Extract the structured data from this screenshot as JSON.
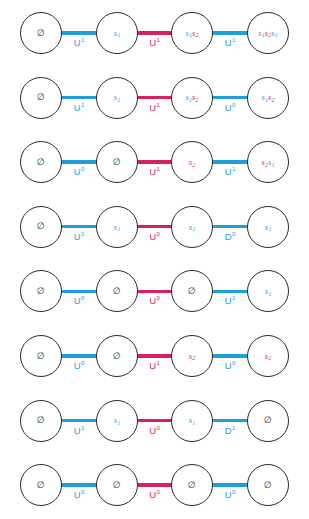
{
  "figure": {
    "colors": {
      "blue": "#1f9ed9",
      "pink": "#d81f5f",
      "node_stroke": "#2b2b2b",
      "background": "#ffffff"
    },
    "empty_set_glyph": "∅",
    "caption": "",
    "rows": [
      {
        "index": 1,
        "nodes": [
          {
            "type": "empty",
            "tokens": []
          },
          {
            "type": "word",
            "tokens": [
              {
                "base": "s",
                "sub": "1",
                "color": "blue"
              }
            ]
          },
          {
            "type": "word",
            "tokens": [
              {
                "base": "s",
                "sub": "1",
                "color": "blue"
              },
              {
                "base": "s",
                "sub": "2",
                "color": "pink"
              }
            ]
          },
          {
            "type": "word",
            "tokens": [
              {
                "base": "s",
                "sub": "1",
                "color": "blue"
              },
              {
                "base": "s",
                "sub": "2",
                "color": "pink"
              },
              {
                "base": "s",
                "sub": "1",
                "color": "blue"
              }
            ]
          }
        ],
        "edges": [
          {
            "letter": "U",
            "exponent": "1",
            "color": "blue"
          },
          {
            "letter": "U",
            "exponent": "1",
            "color": "pink"
          },
          {
            "letter": "U",
            "exponent": "1",
            "color": "blue"
          }
        ]
      },
      {
        "index": 2,
        "nodes": [
          {
            "type": "empty",
            "tokens": []
          },
          {
            "type": "word",
            "tokens": [
              {
                "base": "s",
                "sub": "1",
                "color": "blue"
              }
            ]
          },
          {
            "type": "word",
            "tokens": [
              {
                "base": "s",
                "sub": "1",
                "color": "blue"
              },
              {
                "base": "s",
                "sub": "2",
                "color": "pink"
              }
            ]
          },
          {
            "type": "word",
            "tokens": [
              {
                "base": "s",
                "sub": "1",
                "color": "blue"
              },
              {
                "base": "s",
                "sub": "2",
                "color": "pink"
              }
            ]
          }
        ],
        "edges": [
          {
            "letter": "U",
            "exponent": "1",
            "color": "blue"
          },
          {
            "letter": "U",
            "exponent": "1",
            "color": "pink"
          },
          {
            "letter": "U",
            "exponent": "0",
            "color": "blue"
          }
        ]
      },
      {
        "index": 3,
        "nodes": [
          {
            "type": "empty",
            "tokens": []
          },
          {
            "type": "empty",
            "tokens": []
          },
          {
            "type": "word",
            "tokens": [
              {
                "base": "s",
                "sub": "2",
                "color": "pink"
              }
            ]
          },
          {
            "type": "word",
            "tokens": [
              {
                "base": "s",
                "sub": "2",
                "color": "pink"
              },
              {
                "base": "s",
                "sub": "1",
                "color": "blue"
              }
            ]
          }
        ],
        "edges": [
          {
            "letter": "U",
            "exponent": "0",
            "color": "blue"
          },
          {
            "letter": "U",
            "exponent": "1",
            "color": "pink"
          },
          {
            "letter": "U",
            "exponent": "1",
            "color": "blue"
          }
        ]
      },
      {
        "index": 4,
        "nodes": [
          {
            "type": "empty",
            "tokens": []
          },
          {
            "type": "word",
            "tokens": [
              {
                "base": "s",
                "sub": "1",
                "color": "blue"
              }
            ]
          },
          {
            "type": "word",
            "tokens": [
              {
                "base": "s",
                "sub": "1",
                "color": "blue"
              }
            ]
          },
          {
            "type": "word",
            "tokens": [
              {
                "base": "s",
                "sub": "1",
                "color": "blue"
              }
            ]
          }
        ],
        "edges": [
          {
            "letter": "U",
            "exponent": "1",
            "color": "blue"
          },
          {
            "letter": "U",
            "exponent": "0",
            "color": "pink"
          },
          {
            "letter": "D",
            "exponent": "0",
            "color": "blue"
          }
        ]
      },
      {
        "index": 5,
        "nodes": [
          {
            "type": "empty",
            "tokens": []
          },
          {
            "type": "empty",
            "tokens": []
          },
          {
            "type": "empty",
            "tokens": []
          },
          {
            "type": "word",
            "tokens": [
              {
                "base": "s",
                "sub": "1",
                "color": "blue"
              }
            ]
          }
        ],
        "edges": [
          {
            "letter": "U",
            "exponent": "0",
            "color": "blue"
          },
          {
            "letter": "U",
            "exponent": "0",
            "color": "pink"
          },
          {
            "letter": "U",
            "exponent": "1",
            "color": "blue"
          }
        ]
      },
      {
        "index": 6,
        "nodes": [
          {
            "type": "empty",
            "tokens": []
          },
          {
            "type": "empty",
            "tokens": []
          },
          {
            "type": "word",
            "tokens": [
              {
                "base": "s",
                "sub": "2",
                "color": "pink"
              }
            ]
          },
          {
            "type": "word",
            "tokens": [
              {
                "base": "s",
                "sub": "2",
                "color": "pink"
              }
            ]
          }
        ],
        "edges": [
          {
            "letter": "U",
            "exponent": "0",
            "color": "blue"
          },
          {
            "letter": "U",
            "exponent": "1",
            "color": "pink"
          },
          {
            "letter": "U",
            "exponent": "0",
            "color": "blue"
          }
        ]
      },
      {
        "index": 7,
        "nodes": [
          {
            "type": "empty",
            "tokens": []
          },
          {
            "type": "word",
            "tokens": [
              {
                "base": "s",
                "sub": "1",
                "color": "blue"
              }
            ]
          },
          {
            "type": "word",
            "tokens": [
              {
                "base": "s",
                "sub": "1",
                "color": "blue"
              }
            ]
          },
          {
            "type": "empty",
            "tokens": []
          }
        ],
        "edges": [
          {
            "letter": "U",
            "exponent": "1",
            "color": "blue"
          },
          {
            "letter": "U",
            "exponent": "0",
            "color": "pink"
          },
          {
            "letter": "D",
            "exponent": "1",
            "color": "blue"
          }
        ]
      },
      {
        "index": 8,
        "nodes": [
          {
            "type": "empty",
            "tokens": []
          },
          {
            "type": "empty",
            "tokens": []
          },
          {
            "type": "empty",
            "tokens": []
          },
          {
            "type": "empty",
            "tokens": []
          }
        ],
        "edges": [
          {
            "letter": "U",
            "exponent": "0",
            "color": "blue"
          },
          {
            "letter": "U",
            "exponent": "0",
            "color": "pink"
          },
          {
            "letter": "U",
            "exponent": "0",
            "color": "blue"
          }
        ]
      }
    ]
  }
}
